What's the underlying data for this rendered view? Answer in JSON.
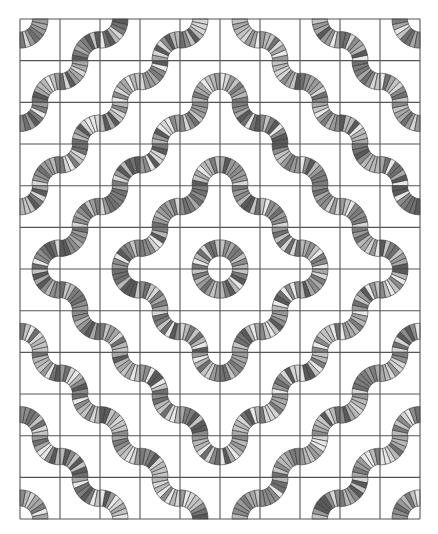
{
  "quilt": {
    "title": "Wavy rings quilt pattern",
    "canvas": {
      "width": 438,
      "height": 534
    },
    "grid": {
      "x0": 20,
      "y0": 19,
      "cols": 10,
      "rows": 12,
      "cell_w": 40,
      "cell_h": 41.67,
      "line_color": "#555555",
      "line_width": 1.1,
      "center_corner": {
        "col": 5,
        "row": 6
      }
    },
    "band": {
      "inner_radius": 12.5,
      "outer_radius": 28,
      "segments_per_quarter": 8,
      "stroke_color": "#333333",
      "stroke_width": 0.6,
      "rule": "odd |u|+|v| -> arc at corner toward center; even -> arc at corner away from center"
    },
    "palette": [
      "#5a5a5a",
      "#8c8c8c",
      "#a8a8a8",
      "#c4c4c4",
      "#e8e8e8",
      "#9a9a9a",
      "#707070",
      "#b8b8b8",
      "#d6d6d6",
      "#7c7c7c"
    ]
  }
}
